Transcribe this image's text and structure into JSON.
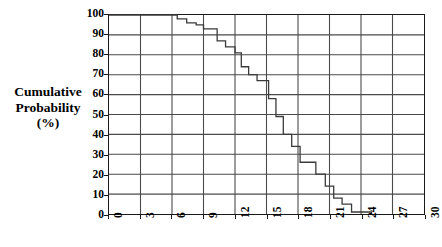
{
  "chart_data": {
    "type": "line",
    "subtype": "step-cumulative-distribution",
    "title": "",
    "xlabel": "",
    "ylabel": "Cumulative Probability (%)",
    "ylabel_lines": [
      "Cumulative",
      "Probability",
      "(%)"
    ],
    "xlim": [
      0,
      30
    ],
    "ylim": [
      0,
      100
    ],
    "xticks": [
      0,
      3,
      6,
      9,
      12,
      15,
      18,
      21,
      24,
      27,
      30
    ],
    "yticks": [
      0,
      10,
      20,
      30,
      40,
      50,
      60,
      70,
      80,
      90,
      100
    ],
    "xtick_labels": [
      "0",
      "3",
      "6",
      "9",
      "12",
      "15",
      "18",
      "21",
      "24",
      "27",
      "30"
    ],
    "ytick_labels": [
      "0",
      "10",
      "20",
      "30",
      "40",
      "50",
      "60",
      "70",
      "80",
      "90",
      "100"
    ],
    "xtick_rotation": -90,
    "grid": true,
    "grid_color": "#4a4a4a",
    "axis_color": "#1a1a1a",
    "line_color": "#3a3a3a",
    "line_width": 1.3,
    "legend": null,
    "series": [
      {
        "name": "Cumulative probability",
        "step": "post",
        "x": [
          0.0,
          5.3,
          6.5,
          7.4,
          8.3,
          9.0,
          10.3,
          11.1,
          12.0,
          12.6,
          13.3,
          14.1,
          15.2,
          15.9,
          16.6,
          17.4,
          18.2,
          18.9,
          19.7,
          20.6,
          21.4,
          22.2,
          23.1,
          24.2,
          25.0
        ],
        "y": [
          100,
          100,
          98,
          96,
          95,
          93,
          93,
          87,
          81,
          81,
          74,
          67,
          58,
          58,
          49,
          40,
          34,
          34,
          26,
          20,
          14,
          8,
          5,
          1,
          0
        ],
        "points": [
          {
            "x": 0.0,
            "y": 100
          },
          {
            "x": 5.3,
            "y": 100
          },
          {
            "x": 6.5,
            "y": 98
          },
          {
            "x": 7.4,
            "y": 96
          },
          {
            "x": 8.3,
            "y": 95
          },
          {
            "x": 9.0,
            "y": 93
          },
          {
            "x": 10.3,
            "y": 87
          },
          {
            "x": 11.1,
            "y": 84
          },
          {
            "x": 12.0,
            "y": 81
          },
          {
            "x": 12.6,
            "y": 74
          },
          {
            "x": 13.3,
            "y": 70
          },
          {
            "x": 14.1,
            "y": 67
          },
          {
            "x": 15.2,
            "y": 58
          },
          {
            "x": 15.9,
            "y": 49
          },
          {
            "x": 16.6,
            "y": 40
          },
          {
            "x": 17.4,
            "y": 34
          },
          {
            "x": 18.2,
            "y": 26
          },
          {
            "x": 18.9,
            "y": 26
          },
          {
            "x": 19.7,
            "y": 20
          },
          {
            "x": 20.6,
            "y": 14
          },
          {
            "x": 21.4,
            "y": 8
          },
          {
            "x": 22.2,
            "y": 5
          },
          {
            "x": 23.1,
            "y": 1
          },
          {
            "x": 24.2,
            "y": 1
          },
          {
            "x": 25.0,
            "y": 0
          }
        ]
      }
    ]
  }
}
